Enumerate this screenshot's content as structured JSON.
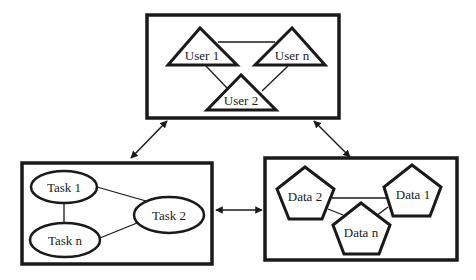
{
  "diagram": {
    "colors": {
      "stroke": "#1a1a1a",
      "background": "#ffffff"
    },
    "groups": [
      {
        "id": "users",
        "shape": "triangle",
        "nodes": [
          {
            "id": "user1",
            "label": "User 1"
          },
          {
            "id": "usern",
            "label": "User n"
          },
          {
            "id": "user2",
            "label": "User 2"
          }
        ],
        "edges": [
          [
            "user1",
            "usern"
          ],
          [
            "user1",
            "user2"
          ],
          [
            "usern",
            "user2"
          ]
        ]
      },
      {
        "id": "tasks",
        "shape": "ellipse",
        "nodes": [
          {
            "id": "task1",
            "label": "Task 1"
          },
          {
            "id": "taskn",
            "label": "Task n"
          },
          {
            "id": "task2",
            "label": "Task 2"
          }
        ],
        "edges": [
          [
            "task1",
            "taskn"
          ],
          [
            "task1",
            "task2"
          ],
          [
            "taskn",
            "task2"
          ]
        ]
      },
      {
        "id": "data",
        "shape": "pentagon",
        "nodes": [
          {
            "id": "data2",
            "label": "Data 2"
          },
          {
            "id": "data1",
            "label": "Data 1"
          },
          {
            "id": "datan",
            "label": "Data n"
          }
        ],
        "edges": [
          [
            "data2",
            "data1"
          ],
          [
            "data2",
            "datan"
          ],
          [
            "data1",
            "datan"
          ]
        ]
      }
    ],
    "group_links": [
      {
        "from": "users",
        "to": "tasks",
        "type": "bidirectional"
      },
      {
        "from": "users",
        "to": "data",
        "type": "bidirectional"
      },
      {
        "from": "tasks",
        "to": "data",
        "type": "bidirectional"
      }
    ]
  }
}
